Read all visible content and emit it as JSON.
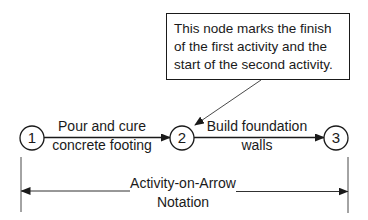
{
  "callout": {
    "lines": [
      "This node marks the finish",
      "of the first activity and the",
      "start of the second activity."
    ]
  },
  "nodes": [
    {
      "id": "1",
      "label": "1"
    },
    {
      "id": "2",
      "label": "2"
    },
    {
      "id": "3",
      "label": "3"
    }
  ],
  "activities": [
    {
      "from": "1",
      "to": "2",
      "lines": [
        "Pour and cure",
        "concrete footing"
      ]
    },
    {
      "from": "2",
      "to": "3",
      "lines": [
        "Build foundation",
        "walls"
      ]
    }
  ],
  "notation": {
    "lines": [
      "Activity-on-Arrow",
      "Notation"
    ]
  },
  "colors": {
    "ink": "#1a1a1a",
    "background": "#ffffff"
  }
}
